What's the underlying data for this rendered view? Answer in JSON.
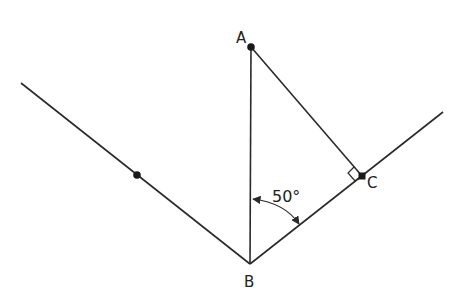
{
  "diagram": {
    "type": "geometry",
    "colors": {
      "stroke": "#2a2a2a",
      "background": "#ffffff"
    },
    "points": {
      "A": {
        "label": "A",
        "x": 251,
        "y": 47
      },
      "B": {
        "label": "B",
        "x": 250,
        "y": 264
      },
      "C": {
        "label": "C",
        "x": 362,
        "y": 176
      },
      "D": {
        "label": "",
        "x": 137,
        "y": 175
      }
    },
    "labels": {
      "A": "A",
      "B": "B",
      "C": "C"
    },
    "angle": {
      "value": 50,
      "text": "50°",
      "between": [
        "BA",
        "BC"
      ]
    },
    "right_angle_at": "C",
    "lines": [
      {
        "name": "left-ray",
        "from": [
          21,
          83
        ],
        "to": [
          250,
          264
        ]
      },
      {
        "name": "right-ray",
        "from": [
          250,
          264
        ],
        "to": [
          443,
          112
        ]
      },
      {
        "name": "segment-AB",
        "from": [
          251,
          47
        ],
        "to": [
          250,
          264
        ]
      },
      {
        "name": "segment-AC",
        "from": [
          251,
          47
        ],
        "to": [
          362,
          176
        ]
      }
    ]
  }
}
